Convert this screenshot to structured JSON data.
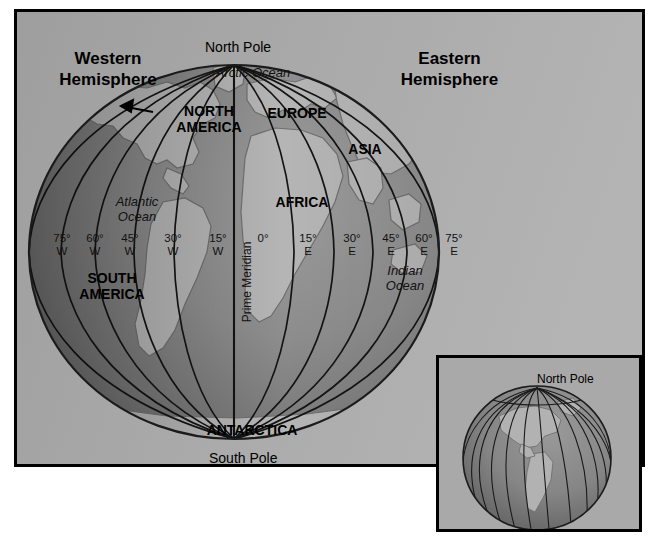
{
  "figure": {
    "type": "globe-map-diagram"
  },
  "colors": {
    "page_background": "#ffffff",
    "panel_background": "#a8a8a8",
    "frame_border": "#000000",
    "ocean_lit": "#8f8f8f",
    "ocean_shadow": "#6d6d6d",
    "land_lit": "#b9b9b9",
    "land_shadow": "#8a8a8a",
    "meridian_line": "#121212",
    "text": "#000000"
  },
  "headings": {
    "western": "Western\nHemisphere",
    "eastern": "Eastern\nHemisphere"
  },
  "poles": {
    "north": "North Pole",
    "south": "South Pole"
  },
  "oceans": {
    "arctic": "Arctic Ocean",
    "atlantic": "Atlantic\nOcean",
    "indian": "Indian\nOcean"
  },
  "continents": {
    "north_america": "NORTH\nAMERICA",
    "south_america": "SOUTH\nAMERICA",
    "europe": "EUROPE",
    "asia": "ASIA",
    "africa": "AFRICA",
    "antarctica": "ANTARCTICA"
  },
  "prime_meridian": {
    "label": "Prime Meridian",
    "value": "0°"
  },
  "longitude_labels": [
    {
      "text": "75°\nW",
      "x": 32,
      "degrees": 75,
      "hemisphere": "W"
    },
    {
      "text": "60°\nW",
      "x": 65,
      "degrees": 60,
      "hemisphere": "W"
    },
    {
      "text": "45°\nW",
      "x": 100,
      "degrees": 45,
      "hemisphere": "W"
    },
    {
      "text": "30°\nW",
      "x": 143,
      "degrees": 30,
      "hemisphere": "W"
    },
    {
      "text": "15°\nW",
      "x": 188,
      "degrees": 15,
      "hemisphere": "W"
    },
    {
      "text": "0°",
      "x": 233,
      "degrees": 0,
      "hemisphere": ""
    },
    {
      "text": "15°\nE",
      "x": 278,
      "degrees": 15,
      "hemisphere": "E"
    },
    {
      "text": "30°\nE",
      "x": 322,
      "degrees": 30,
      "hemisphere": "E"
    },
    {
      "text": "45°\nE",
      "x": 361,
      "degrees": 45,
      "hemisphere": "E"
    },
    {
      "text": "60°\nE",
      "x": 394,
      "degrees": 60,
      "hemisphere": "E"
    },
    {
      "text": "75°\nE",
      "x": 424,
      "degrees": 75,
      "hemisphere": "E"
    }
  ],
  "inset": {
    "north_pole_label": "North Pole",
    "description": "Globe tilted toward viewer showing meridians converging at the North Pole"
  },
  "annotations": {
    "north_america_pointer": "arrow pointing from NORTH AMERICA label to the continent"
  }
}
